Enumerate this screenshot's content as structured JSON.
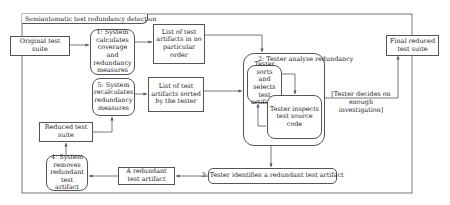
{
  "frame": {
    "title": "Semiautomatic test redundancy detection"
  },
  "nodes": {
    "original_suite": "Original test suite",
    "step1": "1: System calculates coverage and redundancy measures",
    "list_unordered": "List of test artifacts in no particular order",
    "final_suite": "Final reduced test suite",
    "step2": "2: Tester analyse redundancy",
    "tester_sorts": "Tester sorts and selects test artifacts",
    "tester_inspects": "Tester inspects test source code",
    "guard": "[Tester decides on enough investigation]",
    "step5": "5: System recalculates redundancy measures",
    "list_sorted": "List of test artifacts sorted by the tester",
    "reduced_suite": "Reduced test suite",
    "step4": "4: System removes redundant test artifact",
    "redundant_artifact": "A redundant test artifact",
    "step3": "3: Tester identifies a redundant test artifact"
  },
  "colors": {
    "line": "#555555",
    "background": "#ffffff",
    "text": "#222222"
  }
}
